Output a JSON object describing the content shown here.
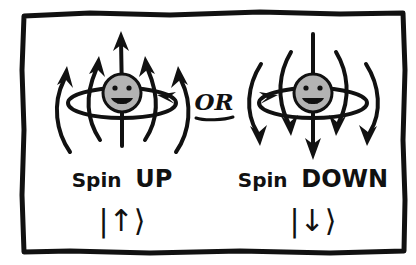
{
  "figure": {
    "kind": "hand-drawn-illustration",
    "background_color": "#ffffff",
    "ink_color": "#111111",
    "sphere_fill_color": "#b3b3b3",
    "border": {
      "name": "hand-drawn rectangular frame",
      "x": 22,
      "y": 12,
      "width": 383,
      "height": 241,
      "stroke_width": 5
    }
  },
  "panels": [
    {
      "id": "spin-up",
      "label": "Spin UP",
      "label_plain": "Spin",
      "label_emphasis": "UP",
      "ket": "|↑⟩",
      "ket_arrow": "↑",
      "center_x": 122,
      "center_y": 95,
      "axis_direction": "up",
      "rotation_direction": "counterclockwise",
      "ring_arrow_glyph": "←",
      "field_arrows": 5,
      "face": "smiley"
    },
    {
      "id": "spin-down",
      "label": "Spin DOWN",
      "label_plain": "Spin",
      "label_emphasis": "DOWN",
      "ket": "|↓⟩",
      "ket_arrow": "↓",
      "center_x": 313,
      "center_y": 95,
      "axis_direction": "down",
      "rotation_direction": "clockwise",
      "ring_arrow_glyph": "→",
      "field_arrows": 5,
      "face": "smiley"
    }
  ],
  "connector": {
    "text": "OR",
    "underlined": true,
    "x": 214,
    "y": 110
  }
}
